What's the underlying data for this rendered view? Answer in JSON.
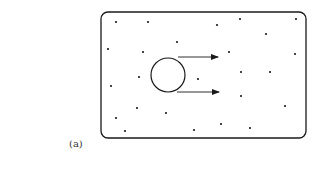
{
  "figure": {
    "label": "(a)",
    "container": {
      "x": 101,
      "y": 12,
      "width": 205,
      "height": 126,
      "corner_radius": 7
    },
    "sphere": {
      "cx": 168,
      "cy": 75,
      "r": 17
    },
    "arrows": [
      {
        "x1": 178,
        "y1": 57,
        "x2": 218,
        "y2": 57
      },
      {
        "x1": 177,
        "y1": 92,
        "x2": 219,
        "y2": 92
      }
    ],
    "particles": [
      [
        116,
        22
      ],
      [
        148,
        22
      ],
      [
        217,
        25
      ],
      [
        240,
        19
      ],
      [
        296,
        19
      ],
      [
        266,
        34
      ],
      [
        177,
        42
      ],
      [
        108,
        49
      ],
      [
        143,
        52
      ],
      [
        229,
        52
      ],
      [
        295,
        54
      ],
      [
        139,
        77
      ],
      [
        198,
        79
      ],
      [
        241,
        72
      ],
      [
        270,
        72
      ],
      [
        111,
        86
      ],
      [
        241,
        96
      ],
      [
        285,
        106
      ],
      [
        137,
        108
      ],
      [
        166,
        113
      ],
      [
        116,
        118
      ],
      [
        221,
        124
      ],
      [
        125,
        131
      ],
      [
        194,
        130
      ],
      [
        250,
        128
      ]
    ],
    "colors": {
      "stroke": "#1a1a1a",
      "background": "#ffffff"
    }
  }
}
